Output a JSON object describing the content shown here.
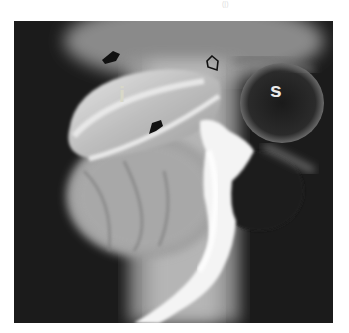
{
  "figure": {
    "type": "radiograph",
    "labels": [
      {
        "id": "intestine-label",
        "text": "i",
        "color": "#d8d8c8"
      },
      {
        "id": "stomach-label",
        "text": "s",
        "color": "#e8e8e8"
      }
    ],
    "arrows": [
      {
        "id": "arrow-upper-left",
        "style": "solid",
        "color": "#111111"
      },
      {
        "id": "arrow-middle",
        "style": "solid",
        "color": "#111111"
      },
      {
        "id": "arrow-open",
        "style": "open",
        "color": "#111111"
      }
    ],
    "top_fragment": "(|)"
  }
}
